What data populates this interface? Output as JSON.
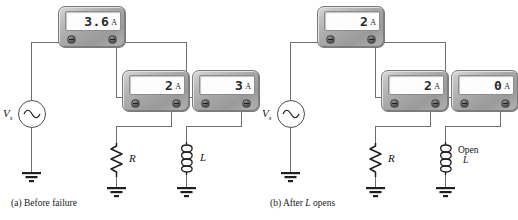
{
  "figure": {
    "panels": [
      {
        "id": "a",
        "caption": "(a) Before failure",
        "caption_prefix": "(a)",
        "caption_text": "Before failure",
        "source": {
          "label": "V",
          "subscript": "s",
          "symbol": "ac-sine"
        },
        "meters": [
          {
            "name": "total-current-meter",
            "value": "3.6",
            "unit": "A",
            "position": "top"
          },
          {
            "name": "resistor-branch-meter",
            "value": "2",
            "unit": "A",
            "position": "middle-left"
          },
          {
            "name": "inductor-branch-meter",
            "value": "3",
            "unit": "A",
            "position": "middle-right"
          }
        ],
        "components": [
          {
            "name": "resistor",
            "label": "R",
            "type": "resistor"
          },
          {
            "name": "inductor",
            "label": "L",
            "type": "inductor"
          }
        ],
        "annotations": []
      },
      {
        "id": "b",
        "caption": "(b) After L opens",
        "caption_prefix": "(b)",
        "caption_text": "After",
        "caption_italic": "L",
        "caption_suffix": "opens",
        "source": {
          "label": "V",
          "subscript": "s",
          "symbol": "ac-sine"
        },
        "meters": [
          {
            "name": "total-current-meter",
            "value": "2",
            "unit": "A",
            "position": "top"
          },
          {
            "name": "resistor-branch-meter",
            "value": "2",
            "unit": "A",
            "position": "middle-left"
          },
          {
            "name": "inductor-branch-meter",
            "value": "0",
            "unit": "A",
            "position": "middle-right"
          }
        ],
        "components": [
          {
            "name": "resistor",
            "label": "R",
            "type": "resistor"
          },
          {
            "name": "inductor",
            "label": "L",
            "type": "inductor"
          }
        ],
        "annotations": [
          {
            "name": "open-inductor-note",
            "line1": "Open",
            "line2": "L"
          }
        ]
      }
    ],
    "colors": {
      "wire": "#6f6f6f",
      "node": "#1b1b1b",
      "meter_body": "#a8a8a8",
      "meter_screen": "#fdfdfd",
      "text": "#111111"
    }
  }
}
